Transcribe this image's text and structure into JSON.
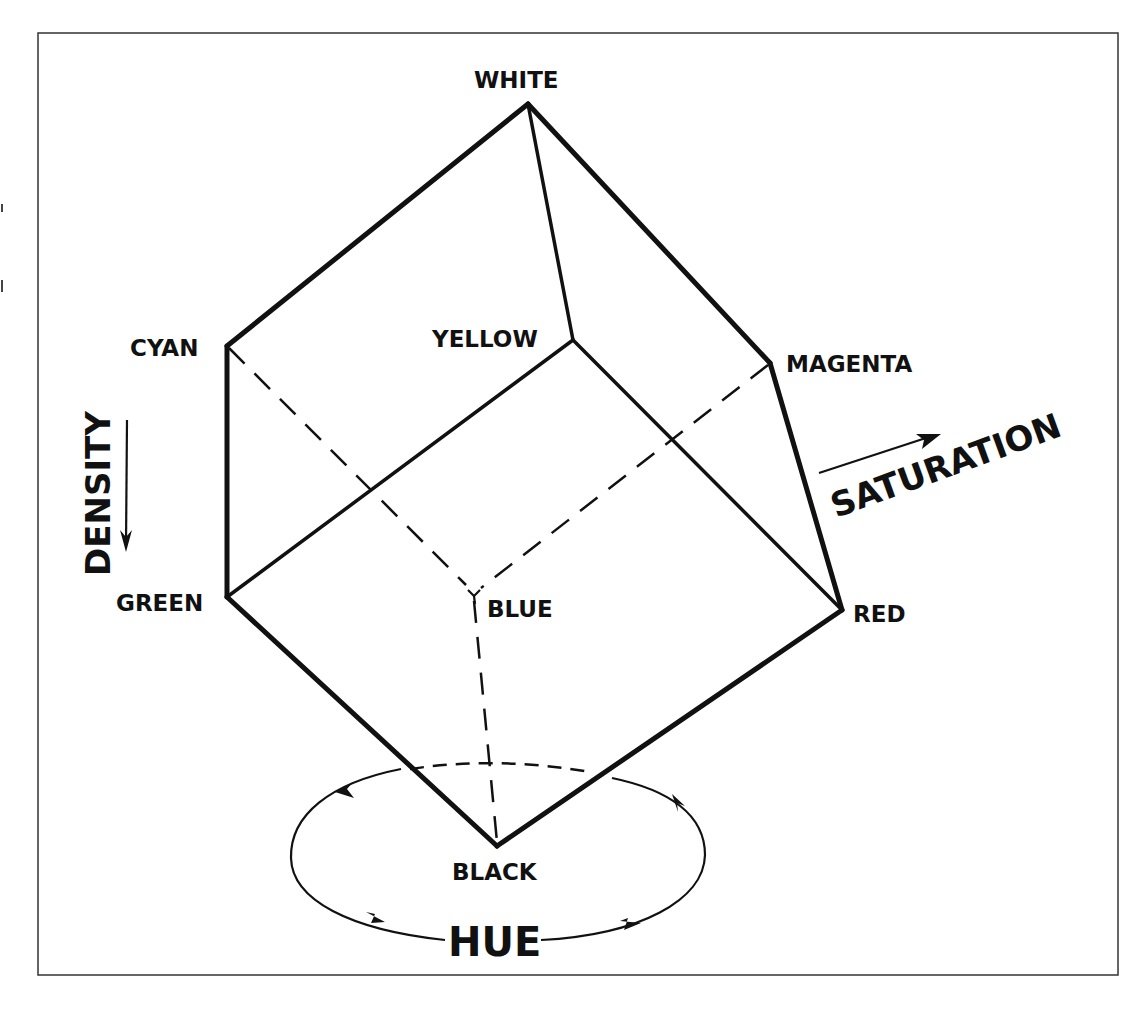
{
  "diagram": {
    "vertices": {
      "white": "WHITE",
      "cyan": "CYAN",
      "yellow": "YELLOW",
      "magenta": "MAGENTA",
      "green": "GREEN",
      "blue": "BLUE",
      "red": "RED",
      "black": "BLACK"
    },
    "axes": {
      "density": "DENSITY",
      "saturation": "SATURATION",
      "hue": "HUE"
    },
    "colors": {
      "ink": "#111111",
      "background": "#ffffff",
      "frame": "#333333"
    }
  }
}
